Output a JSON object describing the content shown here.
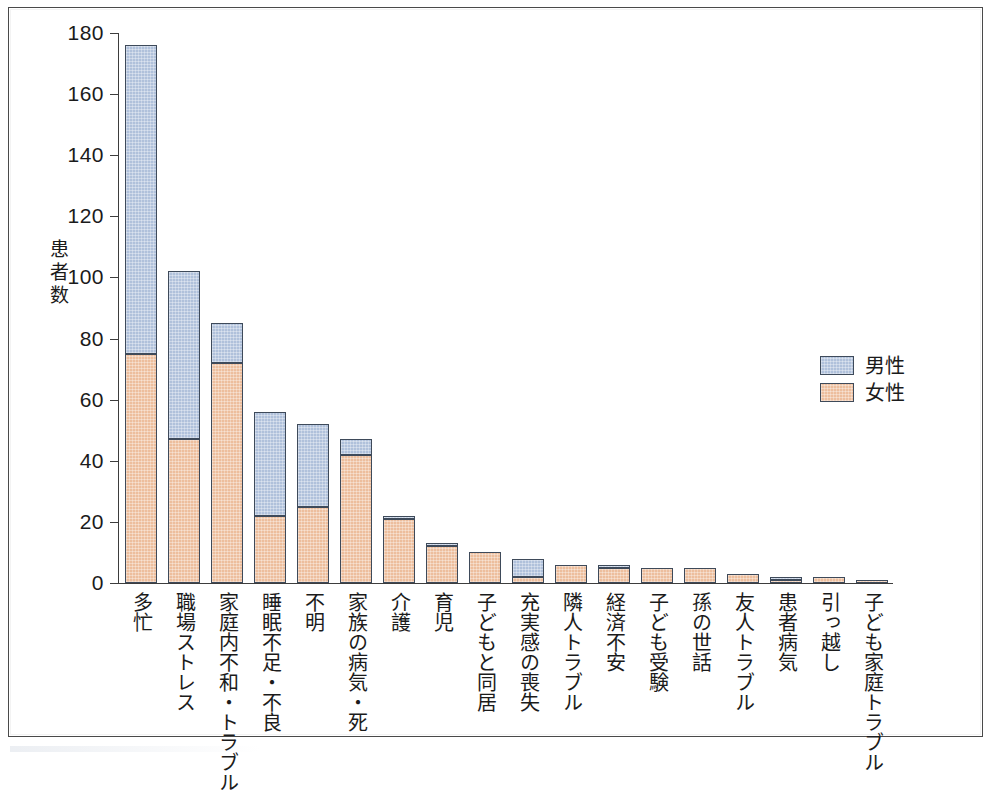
{
  "chart_data": {
    "type": "bar",
    "subtype": "stacked-vertical",
    "title": "",
    "xlabel": "",
    "ylabel": "患者数",
    "ylim": [
      0,
      180
    ],
    "ytick_step": 20,
    "yticks": [
      "180",
      "160",
      "140",
      "120",
      "100",
      "80",
      "60",
      "40",
      "20",
      "0"
    ],
    "grid": false,
    "legend_position": "right-middle",
    "categories": [
      "多忙",
      "職場ストレス",
      "家庭内不和・トラブル",
      "睡眠不足・不良",
      "不明",
      "家族の病気・死",
      "介護",
      "育児",
      "子どもと同居",
      "充実感の喪失",
      "隣人トラブル",
      "経済不安",
      "子ども受験",
      "孫の世話",
      "友人トラブル",
      "患者病気",
      "引っ越し",
      "子ども家庭トラブル"
    ],
    "series": [
      {
        "name": "女性",
        "color": "#edbe9d",
        "values": [
          75,
          47,
          72,
          22,
          25,
          42,
          21,
          12,
          10,
          2,
          6,
          5,
          5,
          5,
          3,
          1,
          2,
          1
        ]
      },
      {
        "name": "男性",
        "color": "#b0c1db",
        "values": [
          101,
          55,
          13,
          34,
          27,
          5,
          1,
          1,
          0,
          6,
          0,
          1,
          0,
          0,
          0,
          1,
          0,
          0
        ]
      }
    ],
    "totals": [
      176,
      102,
      85,
      56,
      52,
      47,
      22,
      13,
      10,
      8,
      6,
      6,
      5,
      5,
      3,
      2,
      2,
      1
    ]
  },
  "axis": {
    "y_title_chars": [
      "患",
      "者",
      "数"
    ],
    "y_tick_labels": [
      "180",
      "160",
      "140",
      "120",
      "100",
      "80",
      "60",
      "40",
      "20",
      "0"
    ]
  },
  "legend": {
    "items": [
      {
        "label": "男性",
        "color": "#b0c1db"
      },
      {
        "label": "女性",
        "color": "#edbe9d"
      }
    ]
  },
  "colors": {
    "male": "#b0c1db",
    "female": "#edbe9d",
    "bar_outline": "#3e4a5a",
    "axis": "#3d3d3d",
    "frame": "#4a4a4a",
    "text": "#1b1b1b",
    "background": "#ffffff"
  }
}
